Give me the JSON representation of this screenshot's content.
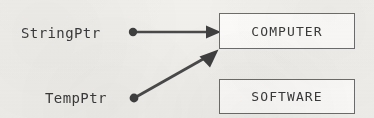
{
  "diagram": {
    "background_color": "#f2f0ed",
    "stroke_color": "#4a4a4a",
    "text_color": "#3b3b3b",
    "box_border_color": "#6d6d6d",
    "box_fill_color": "#fdfcfb"
  },
  "pointers": [
    {
      "id": "string-ptr",
      "label": "StringPtr",
      "label_x": 21,
      "label_baseline_y": 38,
      "dot_x": 133,
      "dot_y": 32,
      "dot_radius": 4,
      "target": "computer-box",
      "arrow_tip_x": 219,
      "arrow_tip_y": 32,
      "arrow_kind": "horizontal"
    },
    {
      "id": "temp-ptr",
      "label": "TempPtr",
      "label_x": 45,
      "label_baseline_y": 103,
      "dot_x": 134,
      "dot_y": 98,
      "dot_radius": 4,
      "target": "computer-box",
      "arrow_tip_x": 218,
      "arrow_tip_y": 49,
      "arrow_kind": "diagonal"
    }
  ],
  "boxes": [
    {
      "id": "computer-box",
      "label": "COMPUTER",
      "x": 219,
      "y": 13,
      "width": 136,
      "height": 36
    },
    {
      "id": "software-box",
      "label": "SOFTWARE",
      "x": 219,
      "y": 79,
      "width": 136,
      "height": 35
    }
  ]
}
